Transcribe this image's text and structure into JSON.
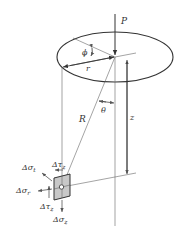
{
  "figure": {
    "colors": {
      "line": "#333333",
      "thin_line": "#666666",
      "element_fill": "#c8c8c8",
      "background": "#ffffff"
    },
    "labels": {
      "load": "P",
      "azimuth": "ϕ",
      "radius": "r",
      "angle": "θ",
      "distance": "R",
      "depth": "z",
      "stress_tau_top": "Δτ",
      "stress_tau_top_sub": "z",
      "stress_sigma_t": "Δσ",
      "stress_sigma_t_sub": "t",
      "stress_sigma_r": "Δσ",
      "stress_sigma_r_sub": "r",
      "stress_tau_bottom": "Δτ",
      "stress_tau_bottom_sub": "z",
      "stress_sigma_z": "Δσ",
      "stress_sigma_z_sub": "z"
    }
  }
}
